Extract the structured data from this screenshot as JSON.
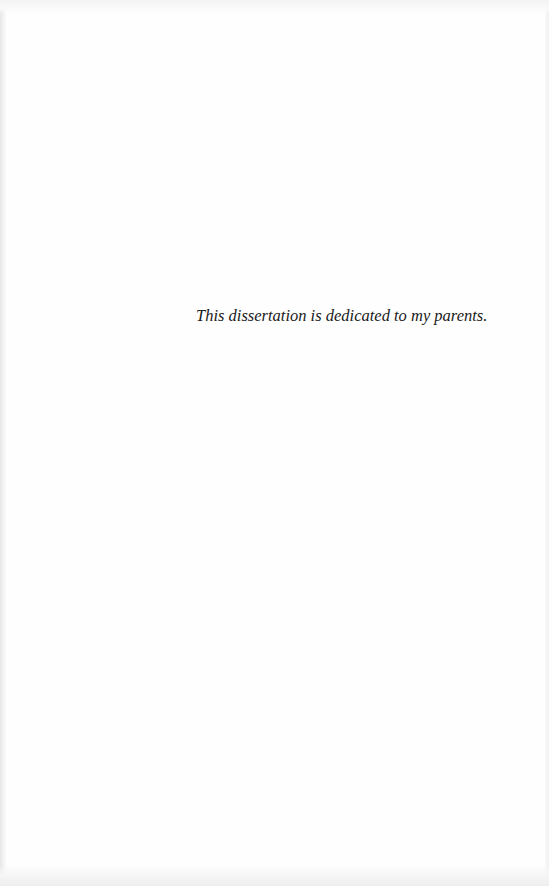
{
  "document": {
    "type": "dedication-page",
    "dedication_text": "This dissertation is dedicated to my parents."
  },
  "colors": {
    "page_background": "#fefefe",
    "text": "#1a1a1a",
    "scan_edge": "#e6e6e6"
  }
}
